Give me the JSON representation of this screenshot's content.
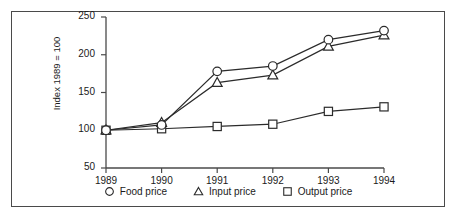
{
  "chart_data": {
    "type": "line",
    "title": "",
    "xlabel": "",
    "ylabel": "Index 1989 = 100",
    "categories": [
      "1989",
      "1990",
      "1991",
      "1992",
      "1993",
      "1994"
    ],
    "x": [
      1989,
      1990,
      1991,
      1992,
      1993,
      1994
    ],
    "ylim": [
      50,
      250
    ],
    "xlim": [
      1989,
      1994
    ],
    "yticks": [
      50,
      100,
      150,
      200,
      250
    ],
    "ytick_labels": [
      "50",
      "100",
      "150",
      "200",
      "250"
    ],
    "xtick_labels": [
      "1989",
      "1990",
      "1991",
      "1992",
      "1993",
      "1994"
    ],
    "grid": false,
    "legend_position": "bottom",
    "series": [
      {
        "name": "Food price",
        "marker": "circle",
        "values": [
          100,
          107,
          178,
          185,
          220,
          232
        ]
      },
      {
        "name": "Input price",
        "marker": "triangle",
        "values": [
          100,
          110,
          163,
          173,
          211,
          226
        ]
      },
      {
        "name": "Output price",
        "marker": "square",
        "values": [
          100,
          102,
          105,
          108,
          125,
          131
        ]
      }
    ],
    "colors": {
      "line": "#2b2b2b",
      "marker_fill": "#ffffff",
      "axis": "#4a4a4a",
      "frame": "#4a4a4a",
      "text": "#1a1a1a",
      "background": "#ffffff"
    }
  },
  "legend": {
    "items": [
      {
        "marker": "circle-marker",
        "label": "Food price"
      },
      {
        "marker": "triangle-marker",
        "label": "Input price"
      },
      {
        "marker": "square-marker",
        "label": "Output price"
      }
    ]
  }
}
